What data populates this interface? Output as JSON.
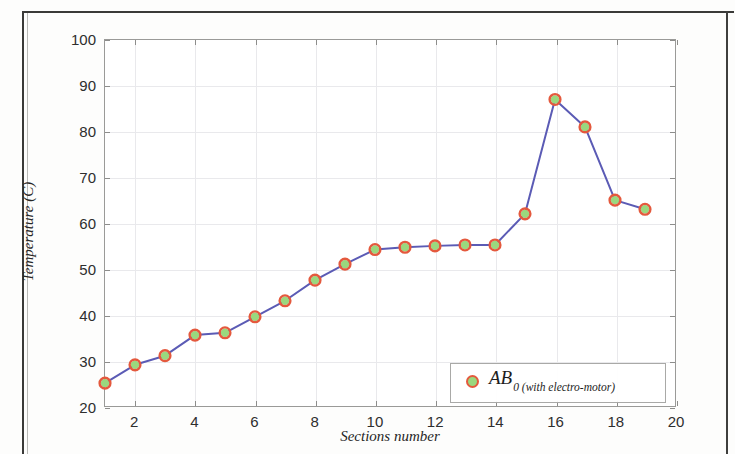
{
  "figure": {
    "background_color": "#ffffff",
    "frame_color": "#3a3a38"
  },
  "axes": {
    "x_title": "Sections number",
    "y_title": "Temperature (C)",
    "x_ticks": [
      "2",
      "4",
      "6",
      "8",
      "10",
      "12",
      "14",
      "16",
      "18",
      "20"
    ],
    "y_ticks": [
      "100",
      "90",
      "80",
      "70",
      "60",
      "50",
      "40",
      "30",
      "20"
    ],
    "grid_color": "#e9e9ec",
    "axis_line_color": "#9a9a98"
  },
  "legend": {
    "label_main": "AB",
    "label_sub": "0 (with electro-motor)",
    "marker_ring_color": "#e4593d",
    "marker_fill_color": "#9ad87e"
  },
  "chart_data": {
    "type": "line",
    "title": "",
    "xlabel": "Sections number",
    "ylabel": "Temperature (C)",
    "xlim": [
      1,
      20
    ],
    "ylim": [
      20,
      100
    ],
    "xtick_values": [
      2,
      4,
      6,
      8,
      10,
      12,
      14,
      16,
      18,
      20
    ],
    "ytick_values": [
      20,
      30,
      40,
      50,
      60,
      70,
      80,
      90,
      100
    ],
    "grid": true,
    "legend_position": "lower right inside",
    "series": [
      {
        "name": "AB0 (with electro-motor)",
        "line_color": "#5b5bb5",
        "marker_ring_color": "#e4593d",
        "marker_fill_color": "#9ad87e",
        "x": [
          1,
          2,
          3,
          4,
          5,
          6,
          7,
          8,
          9,
          10,
          11,
          12,
          13,
          14,
          15,
          16,
          17,
          18,
          19
        ],
        "values": [
          25,
          29,
          31,
          35.5,
          36,
          39.5,
          43,
          47.5,
          51,
          54.2,
          54.7,
          55,
          55.2,
          55.2,
          62,
          87,
          81,
          65,
          63
        ]
      }
    ]
  }
}
